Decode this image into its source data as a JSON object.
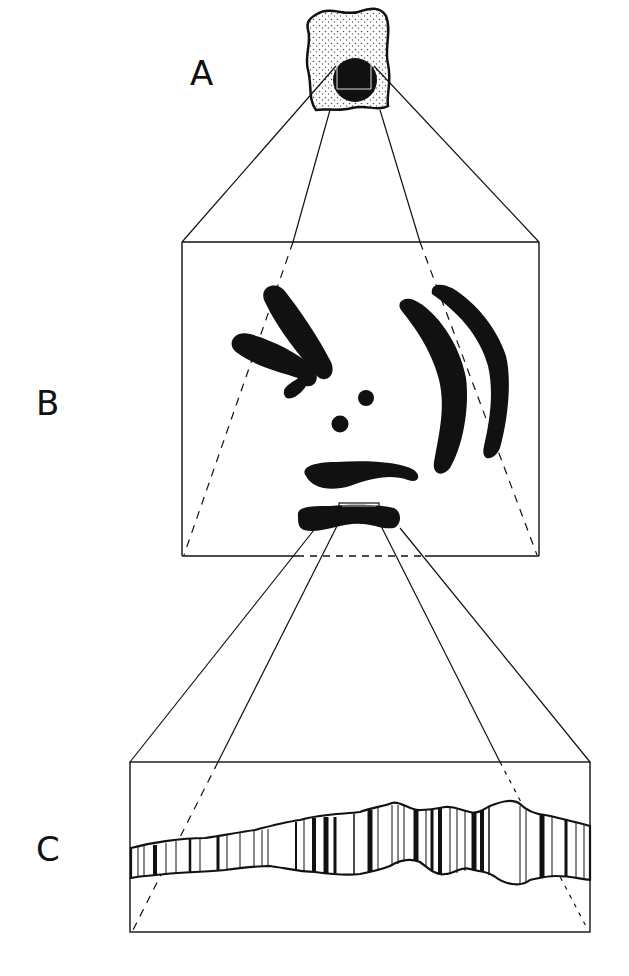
{
  "figure": {
    "panels": [
      {
        "id": "A",
        "label": "A",
        "description": "Whole cell with dark nucleus; small boxed region in nucleus"
      },
      {
        "id": "B",
        "label": "B",
        "description": "Magnified view of boxed region: set of chromosomes"
      },
      {
        "id": "C",
        "label": "C",
        "description": "Magnified view of one chromosome segment showing banding pattern"
      }
    ],
    "colors": {
      "ink": "#111111",
      "background": "#ffffff",
      "stipple": "#555555"
    }
  }
}
